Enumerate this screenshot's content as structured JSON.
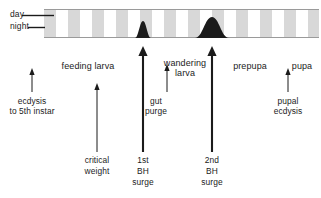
{
  "figure": {
    "type": "developmental-timeline",
    "background_color": "#ffffff",
    "ink_color": "#1b1b1b"
  },
  "photoperiod_bar": {
    "name": "day-night-bar",
    "day_label": "day",
    "night_label": "night",
    "band_light_color": "#ffffff",
    "band_dark_color": "#d8d8d8",
    "bar_outline_color": "#9a9a9a",
    "x_start": 44,
    "x_end": 319,
    "y_top": 9,
    "y_bottom": 38,
    "period_px": 24,
    "bands": [
      {
        "type": "night",
        "x": 44,
        "width": 12
      },
      {
        "type": "day",
        "x": 56,
        "width": 12
      },
      {
        "type": "night",
        "x": 68,
        "width": 12
      },
      {
        "type": "day",
        "x": 80,
        "width": 12
      },
      {
        "type": "night",
        "x": 92,
        "width": 12
      },
      {
        "type": "day",
        "x": 104,
        "width": 12
      },
      {
        "type": "night",
        "x": 116,
        "width": 12
      },
      {
        "type": "day",
        "x": 128,
        "width": 12
      },
      {
        "type": "night",
        "x": 140,
        "width": 12
      },
      {
        "type": "day",
        "x": 152,
        "width": 12
      },
      {
        "type": "night",
        "x": 164,
        "width": 12
      },
      {
        "type": "day",
        "x": 176,
        "width": 12
      },
      {
        "type": "night",
        "x": 188,
        "width": 12
      },
      {
        "type": "day",
        "x": 200,
        "width": 12
      },
      {
        "type": "night",
        "x": 212,
        "width": 12
      },
      {
        "type": "day",
        "x": 224,
        "width": 12
      },
      {
        "type": "night",
        "x": 236,
        "width": 12
      },
      {
        "type": "day",
        "x": 248,
        "width": 12
      },
      {
        "type": "night",
        "x": 260,
        "width": 12
      },
      {
        "type": "day",
        "x": 272,
        "width": 12
      },
      {
        "type": "night",
        "x": 284,
        "width": 12
      },
      {
        "type": "day",
        "x": 296,
        "width": 12
      },
      {
        "type": "night",
        "x": 308,
        "width": 11
      }
    ],
    "peaks": [
      {
        "name": "first-bh-surge-peak",
        "center_x": 143,
        "half_width": 8,
        "height": 17
      },
      {
        "name": "second-bh-surge-peak",
        "center_x": 212,
        "half_width": 17,
        "height": 21
      }
    ]
  },
  "stage_labels": [
    {
      "id": "feeding-larva",
      "text": "feeding  larva",
      "x": 88,
      "y": 62
    },
    {
      "id": "wandering-larva",
      "text": "wandering",
      "x": 185,
      "y": 61
    },
    {
      "id": "wandering-larva-2",
      "text": "larva",
      "x": 185,
      "y": 70
    },
    {
      "id": "prepupa",
      "text": "prepupa",
      "x": 250,
      "y": 62
    },
    {
      "id": "pupa",
      "text": "pupa",
      "x": 302,
      "y": 62
    }
  ],
  "event_labels": [
    {
      "id": "ecdysis",
      "line1": "ecdysis",
      "line2": "to 5th instar",
      "x": 32,
      "y": 99
    },
    {
      "id": "gut-purge",
      "line1": "gut",
      "line2": "purge",
      "x": 156,
      "y": 99
    },
    {
      "id": "pupal-ecdysis",
      "line1": "pupal",
      "line2": "ecdysis",
      "x": 288,
      "y": 99
    }
  ],
  "bottom_labels": [
    {
      "id": "critical-weight",
      "lines": [
        "critical",
        "weight"
      ],
      "x": 97,
      "y": 157
    },
    {
      "id": "first-bh-surge",
      "lines": [
        "1st",
        "BH",
        "surge"
      ],
      "x": 143,
      "y": 157
    },
    {
      "id": "second-bh-surge",
      "lines": [
        "2nd",
        "BH",
        "surge"
      ],
      "x": 212,
      "y": 157
    }
  ],
  "arrows": [
    {
      "id": "ecdysis-arrow",
      "x": 32,
      "y_tail": 92,
      "y_head": 68,
      "weight": "thin"
    },
    {
      "id": "critical-weight-arrow",
      "x": 97,
      "y_tail": 152,
      "y_head": 83,
      "weight": "thin"
    },
    {
      "id": "first-bh-surge-arrow",
      "x": 143,
      "y_tail": 152,
      "y_head": 46,
      "weight": "thick"
    },
    {
      "id": "gut-purge-arrow",
      "x": 167,
      "y_tail": 92,
      "y_head": 64,
      "weight": "thin"
    },
    {
      "id": "second-bh-surge-arrow",
      "x": 212,
      "y_tail": 152,
      "y_head": 46,
      "weight": "thick"
    },
    {
      "id": "pupal-ecdysis-arrow",
      "x": 288,
      "y_tail": 92,
      "y_head": 68,
      "weight": "thin"
    }
  ],
  "leader_lines": [
    {
      "id": "day-leader",
      "x1": 22,
      "x2": 54,
      "y": 15
    },
    {
      "id": "night-leader",
      "x1": 28,
      "x2": 45,
      "y": 27
    }
  ]
}
